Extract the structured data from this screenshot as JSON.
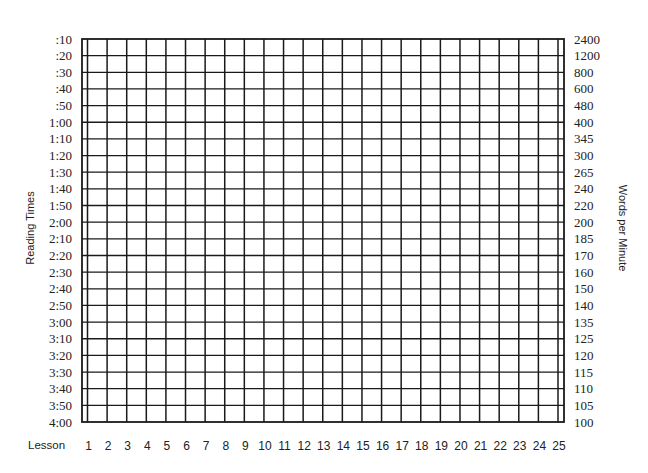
{
  "chart_data": {
    "type": "table",
    "title": "",
    "xlabel": "Lesson",
    "ylabel_left": "Reading Times",
    "ylabel_right": "Words per Minute",
    "x_ticks": [
      1,
      2,
      3,
      4,
      5,
      6,
      7,
      8,
      9,
      10,
      11,
      12,
      13,
      14,
      15,
      16,
      17,
      18,
      19,
      20,
      21,
      22,
      23,
      24,
      25
    ],
    "y_left_ticks": [
      ":10",
      ":20",
      ":30",
      ":40",
      ":50",
      "1:00",
      "1:10",
      "1:20",
      "1:30",
      "1:40",
      "1:50",
      "2:00",
      "2:10",
      "2:20",
      "2:30",
      "2:40",
      "2:50",
      "3:00",
      "3:10",
      "3:20",
      "3:30",
      "3:40",
      "3:50",
      "4:00"
    ],
    "y_right_ticks": [
      2400,
      1200,
      800,
      600,
      480,
      400,
      345,
      300,
      265,
      240,
      220,
      200,
      185,
      170,
      160,
      150,
      140,
      135,
      125,
      120,
      115,
      110,
      105,
      100
    ],
    "series": [],
    "grid": true,
    "legend": null
  },
  "labels": {
    "left_title": "Reading Times",
    "right_title": "Words per Minute",
    "lesson": "Lesson"
  },
  "colors": {
    "grid": "#1a1a1a",
    "text": "#222222",
    "background": "#ffffff"
  }
}
